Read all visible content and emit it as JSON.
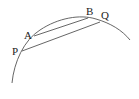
{
  "diagram": {
    "type": "geometry-arc-with-parallel-chords",
    "colors": {
      "stroke": "#555555",
      "label": "#222222",
      "background": "#ffffff"
    },
    "points": [
      {
        "id": "A",
        "label": "A",
        "x": 34,
        "y": 36
      },
      {
        "id": "B",
        "label": "B",
        "x": 88,
        "y": 18
      },
      {
        "id": "P",
        "label": "P",
        "x": 22,
        "y": 51
      },
      {
        "id": "Q",
        "label": "Q",
        "x": 100,
        "y": 22
      }
    ],
    "chords": [
      {
        "from": "A",
        "to": "B"
      },
      {
        "from": "P",
        "to": "Q"
      }
    ],
    "arc": {
      "start": [
        12,
        83
      ],
      "end": [
        130,
        40
      ]
    }
  }
}
